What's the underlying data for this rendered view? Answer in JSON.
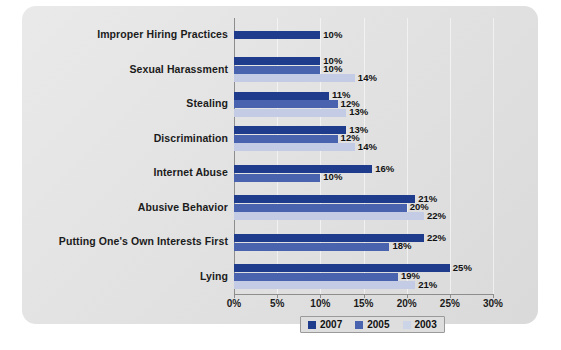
{
  "chart_data": {
    "type": "bar",
    "orientation": "horizontal",
    "title": "",
    "xlabel": "",
    "ylabel": "",
    "xlim": [
      0,
      30
    ],
    "grid": true,
    "legend_position": "bottom",
    "xticks": [
      "0%",
      "5%",
      "10%",
      "15%",
      "20%",
      "25%",
      "30%"
    ],
    "xtick_values": [
      0,
      5,
      10,
      15,
      20,
      25,
      30
    ],
    "categories": [
      "Improper Hiring Practices",
      "Sexual Harassment",
      "Stealing",
      "Discrimination",
      "Internet Abuse",
      "Abusive Behavior",
      "Putting One's Own Interests First",
      "Lying"
    ],
    "series": [
      {
        "name": "2007",
        "color": "#1f3c8c",
        "values": [
          10,
          10,
          11,
          13,
          16,
          21,
          22,
          25
        ],
        "labels": [
          "10%",
          "10%",
          "11%",
          "13%",
          "16%",
          "21%",
          "22%",
          "25%"
        ]
      },
      {
        "name": "2005",
        "color": "#4a63ae",
        "values": [
          null,
          10,
          12,
          12,
          10,
          20,
          18,
          19
        ],
        "labels": [
          null,
          "10%",
          "12%",
          "12%",
          "10%",
          "20%",
          "18%",
          "19%"
        ]
      },
      {
        "name": "2003",
        "color": "#c3cce4",
        "values": [
          null,
          14,
          13,
          14,
          null,
          22,
          null,
          21
        ],
        "labels": [
          null,
          "14%",
          "13%",
          "14%",
          null,
          "22%",
          null,
          "21%"
        ]
      }
    ]
  },
  "legend": {
    "items": [
      {
        "label": "2007",
        "color": "#1f3c8c"
      },
      {
        "label": "2005",
        "color": "#4a63ae"
      },
      {
        "label": "2003",
        "color": "#ccd4e8"
      }
    ]
  },
  "colors": {
    "panel_background": "#dedede",
    "axis": "#8d8d8d",
    "text": "#1b1b1b",
    "series_2007": "#1f3c8c",
    "series_2005": "#4a63ae",
    "series_2003": "#c3cce4"
  }
}
